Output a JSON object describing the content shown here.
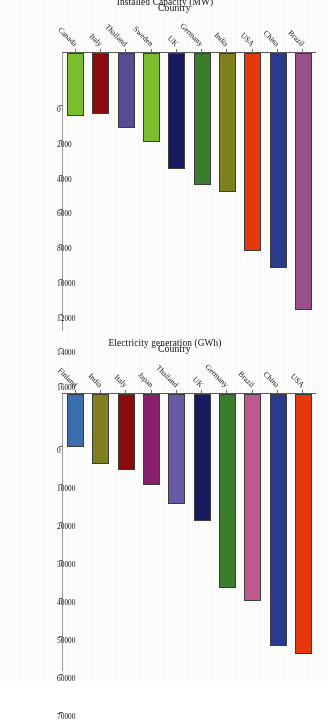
{
  "chart_data": [
    {
      "type": "bar",
      "orientation": "horizontal",
      "title": "",
      "xlabel": "Country",
      "ylabel": "Installed Capacity (MW)",
      "ylim": [
        0,
        16000
      ],
      "ytick_labels": [
        "0",
        "2000",
        "4000",
        "6000",
        "8000",
        "10000",
        "12000",
        "14000",
        "16000"
      ],
      "yticks": [
        0,
        2000,
        4000,
        6000,
        8000,
        10000,
        12000,
        14000,
        16000
      ],
      "grid": false,
      "legend": "none",
      "categories": [
        "Brazil",
        "China",
        "USA",
        "India",
        "Germany",
        "UK",
        "Sweden",
        "Thailand",
        "Italy",
        "Canada"
      ],
      "values": [
        14800,
        12400,
        11400,
        8000,
        7600,
        6700,
        5100,
        4300,
        3500,
        3600
      ],
      "colors": [
        "#9B4F8C",
        "#2A3A8C",
        "#E8380D",
        "#80801F",
        "#3A7D2C",
        "#151B5E",
        "#7CBF2E",
        "#5B4A96",
        "#8B0B0B",
        "#7CBF2E"
      ]
    },
    {
      "type": "bar",
      "orientation": "horizontal",
      "title": "",
      "xlabel": "Country",
      "ylabel": "Electricity generation (GWh)",
      "ylim": [
        0,
        73000
      ],
      "ytick_labels": [
        "0",
        "10000",
        "20000",
        "30000",
        "40000",
        "50000",
        "60000",
        "70000"
      ],
      "yticks": [
        0,
        10000,
        20000,
        30000,
        40000,
        50000,
        60000,
        70000
      ],
      "grid": false,
      "legend": "none",
      "categories": [
        "USA",
        "China",
        "Brazil",
        "Germany",
        "UK",
        "Thailand",
        "Japan",
        "Italy",
        "India",
        "Finland"
      ],
      "values": [
        68500,
        66500,
        54500,
        51000,
        33500,
        29000,
        24000,
        20000,
        18500,
        14000
      ],
      "colors": [
        "#E8380D",
        "#2A3A8C",
        "#BE5A8E",
        "#3A7D2C",
        "#151B5E",
        "#6A5AA8",
        "#8B1F6E",
        "#8B0B0B",
        "#80801F",
        "#3B6FAF"
      ]
    }
  ]
}
